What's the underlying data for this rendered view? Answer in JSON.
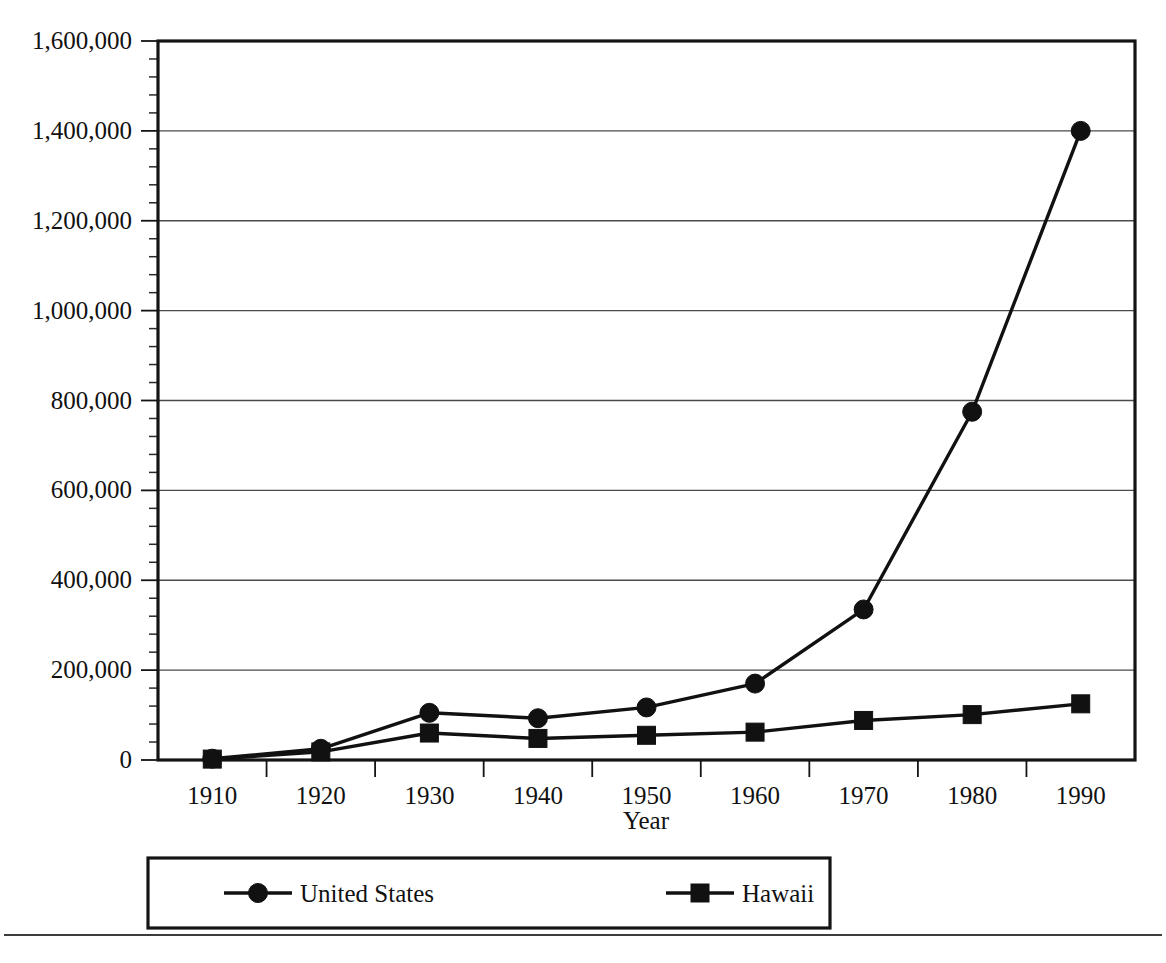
{
  "chart_data": {
    "type": "line",
    "title": "",
    "xlabel": "Year",
    "ylabel": "",
    "categories": [
      "1910",
      "1920",
      "1930",
      "1940",
      "1950",
      "1960",
      "1970",
      "1980",
      "1990"
    ],
    "x": [
      1910,
      1920,
      1930,
      1940,
      1950,
      1960,
      1970,
      1980,
      1990
    ],
    "ylim": [
      0,
      1600000
    ],
    "xlim": [
      1905,
      1995
    ],
    "grid": "horizontal",
    "legend_position": "below-plot",
    "y_ticks": [
      0,
      200000,
      400000,
      600000,
      800000,
      1000000,
      1200000,
      1400000,
      1600000
    ],
    "y_tick_labels": [
      "0",
      "200,000",
      "400,000",
      "600,000",
      "800,000",
      "1,000,000",
      "1,200,000",
      "1,400,000",
      "1,600,000"
    ],
    "y_minor_ticks_per_interval": 4,
    "series": [
      {
        "name": "United States",
        "marker": "circle",
        "values": [
          3000,
          25000,
          105000,
          93000,
          117000,
          170000,
          335000,
          775000,
          1400000
        ]
      },
      {
        "name": "Hawaii",
        "marker": "square",
        "values": [
          2000,
          18000,
          60000,
          48000,
          55000,
          62000,
          88000,
          101000,
          125000
        ]
      }
    ]
  },
  "legend": {
    "entries": [
      {
        "label": "United States",
        "marker": "circle"
      },
      {
        "label": "Hawaii",
        "marker": "square"
      }
    ]
  },
  "axes": {
    "x_title": "Year"
  },
  "colors": {
    "ink": "#111111",
    "grid": "#4a4a4a",
    "background": "#ffffff"
  }
}
